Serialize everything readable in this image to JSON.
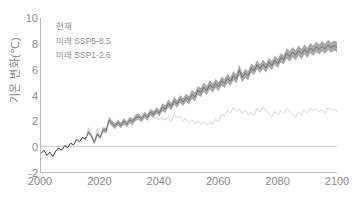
{
  "chart_data": {
    "type": "line",
    "title": "",
    "xlabel": "",
    "ylabel": "기온 변화(℃)",
    "xlim": [
      2000,
      2100
    ],
    "ylim": [
      -2,
      10
    ],
    "grid": false,
    "zero_line": true,
    "legend_position": "top-left",
    "xticks": [
      "2000",
      "2020",
      "2040",
      "2060",
      "2080",
      "2100"
    ],
    "xtick_values": [
      2000,
      2020,
      2040,
      2060,
      2080,
      2100
    ],
    "yticks": [
      "-2",
      "0",
      "2",
      "4",
      "6",
      "8",
      "10"
    ],
    "ytick_values": [
      -2,
      0,
      2,
      4,
      6,
      8,
      10
    ],
    "legend": [
      "현재",
      "미래 SSP5-8.5",
      "미래 SSP1-2.6"
    ],
    "colors": {
      "historical": "#3a3a3a",
      "ssp585_line": "#6e6e6e",
      "ssp585_band": "#9a9a9a",
      "ssp126_line": "#c9c9c9",
      "axis": "#b9b9b9",
      "text": "#8a8a8a"
    },
    "series": [
      {
        "name": "현재",
        "label": "현재",
        "color": "#3a3a3a",
        "x": [
          2000,
          2001,
          2002,
          2003,
          2004,
          2005,
          2006,
          2007,
          2008,
          2009,
          2010,
          2011,
          2012,
          2013,
          2014,
          2015
        ],
        "values": [
          -0.55,
          -0.3,
          -0.7,
          -0.45,
          -0.8,
          -0.35,
          -0.15,
          -0.3,
          0.05,
          -0.1,
          0.25,
          0.1,
          0.55,
          0.35,
          0.7,
          0.55
        ]
      },
      {
        "name": "미래 SSP5-8.5",
        "label": "미래 SSP5-8.5",
        "color": "#6e6e6e",
        "band_color": "#9a9a9a",
        "x": [
          2015,
          2016,
          2017,
          2018,
          2019,
          2020,
          2021,
          2022,
          2023,
          2024,
          2025,
          2026,
          2027,
          2028,
          2029,
          2030,
          2031,
          2032,
          2033,
          2034,
          2035,
          2036,
          2037,
          2038,
          2039,
          2040,
          2041,
          2042,
          2043,
          2044,
          2045,
          2046,
          2047,
          2048,
          2049,
          2050,
          2051,
          2052,
          2053,
          2054,
          2055,
          2056,
          2057,
          2058,
          2059,
          2060,
          2061,
          2062,
          2063,
          2064,
          2065,
          2066,
          2067,
          2068,
          2069,
          2070,
          2071,
          2072,
          2073,
          2074,
          2075,
          2076,
          2077,
          2078,
          2079,
          2080,
          2081,
          2082,
          2083,
          2084,
          2085,
          2086,
          2087,
          2088,
          2089,
          2090,
          2091,
          2092,
          2093,
          2094,
          2095,
          2096,
          2097,
          2098,
          2099,
          2100
        ],
        "values": [
          0.55,
          1.1,
          0.85,
          0.3,
          0.95,
          0.7,
          1.3,
          1.2,
          2.05,
          1.75,
          1.55,
          1.85,
          1.6,
          1.95,
          1.7,
          2.05,
          1.9,
          2.25,
          2.3,
          2.1,
          2.45,
          2.25,
          2.65,
          2.5,
          2.8,
          2.6,
          3.05,
          2.9,
          3.35,
          3.1,
          3.55,
          3.3,
          3.7,
          3.45,
          3.8,
          3.6,
          4.05,
          3.85,
          4.35,
          4.2,
          4.6,
          4.35,
          4.8,
          4.55,
          4.9,
          4.65,
          5.1,
          4.9,
          5.3,
          5.05,
          5.5,
          5.25,
          5.95,
          5.35,
          5.7,
          5.5,
          6.1,
          5.9,
          6.35,
          6.05,
          6.4,
          6.1,
          6.55,
          6.3,
          6.7,
          6.45,
          6.9,
          6.75,
          7.25,
          7.0,
          7.35,
          7.1,
          7.45,
          7.2,
          7.55,
          7.3,
          7.65,
          7.45,
          7.75,
          7.55,
          7.8,
          7.6,
          7.9,
          7.7,
          7.85,
          7.75
        ],
        "band_lower": [
          0.45,
          0.95,
          0.7,
          0.15,
          0.8,
          0.55,
          1.1,
          1.0,
          1.8,
          1.55,
          1.35,
          1.6,
          1.4,
          1.7,
          1.5,
          1.8,
          1.65,
          2.0,
          2.05,
          1.85,
          2.2,
          2.0,
          2.4,
          2.25,
          2.55,
          2.35,
          2.75,
          2.6,
          3.05,
          2.8,
          3.25,
          3.0,
          3.4,
          3.15,
          3.5,
          3.3,
          3.7,
          3.5,
          4.0,
          3.85,
          4.25,
          4.0,
          4.45,
          4.2,
          4.55,
          4.3,
          4.75,
          4.55,
          4.95,
          4.7,
          5.15,
          4.9,
          5.55,
          5.0,
          5.35,
          5.15,
          5.75,
          5.55,
          6.0,
          5.7,
          6.05,
          5.75,
          6.2,
          5.95,
          6.35,
          6.1,
          6.55,
          6.4,
          6.85,
          6.6,
          6.95,
          6.7,
          7.05,
          6.8,
          7.15,
          6.9,
          7.25,
          7.05,
          7.35,
          7.15,
          7.4,
          7.2,
          7.5,
          7.3,
          7.45,
          7.35
        ],
        "band_upper": [
          0.65,
          1.25,
          1.0,
          0.45,
          1.1,
          0.85,
          1.5,
          1.4,
          2.3,
          2.0,
          1.8,
          2.1,
          1.85,
          2.2,
          1.95,
          2.3,
          2.15,
          2.5,
          2.55,
          2.35,
          2.7,
          2.5,
          2.9,
          2.75,
          3.05,
          2.85,
          3.35,
          3.2,
          3.65,
          3.4,
          3.85,
          3.6,
          4.0,
          3.75,
          4.1,
          3.9,
          4.4,
          4.2,
          4.7,
          4.55,
          4.95,
          4.7,
          5.15,
          4.9,
          5.25,
          5.0,
          5.45,
          5.25,
          5.65,
          5.4,
          5.85,
          5.6,
          6.35,
          5.7,
          6.05,
          5.85,
          6.45,
          6.25,
          6.7,
          6.4,
          6.75,
          6.45,
          6.9,
          6.65,
          7.05,
          6.8,
          7.25,
          7.1,
          7.65,
          7.4,
          7.75,
          7.5,
          7.85,
          7.6,
          7.95,
          7.7,
          8.05,
          7.85,
          8.15,
          7.95,
          8.2,
          8.0,
          8.3,
          8.1,
          8.25,
          8.15
        ]
      },
      {
        "name": "미래 SSP1-2.6",
        "label": "미래 SSP1-2.6",
        "color": "#c9c9c9",
        "x": [
          2015,
          2016,
          2017,
          2018,
          2019,
          2020,
          2021,
          2022,
          2023,
          2024,
          2025,
          2026,
          2027,
          2028,
          2029,
          2030,
          2031,
          2032,
          2033,
          2034,
          2035,
          2036,
          2037,
          2038,
          2039,
          2040,
          2041,
          2042,
          2043,
          2044,
          2045,
          2046,
          2047,
          2048,
          2049,
          2050,
          2051,
          2052,
          2053,
          2054,
          2055,
          2056,
          2057,
          2058,
          2059,
          2060,
          2061,
          2062,
          2063,
          2064,
          2065,
          2066,
          2067,
          2068,
          2069,
          2070,
          2071,
          2072,
          2073,
          2074,
          2075,
          2076,
          2077,
          2078,
          2079,
          2080,
          2081,
          2082,
          2083,
          2084,
          2085,
          2086,
          2087,
          2088,
          2089,
          2090,
          2091,
          2092,
          2093,
          2094,
          2095,
          2096,
          2097,
          2098,
          2099,
          2100
        ],
        "values": [
          0.55,
          1.45,
          0.8,
          0.25,
          1.4,
          0.6,
          1.25,
          1.15,
          1.95,
          1.7,
          1.5,
          1.8,
          1.55,
          1.9,
          1.65,
          1.95,
          1.8,
          2.1,
          2.2,
          2.0,
          2.3,
          2.15,
          2.35,
          2.2,
          2.25,
          2.1,
          2.2,
          2.05,
          2.3,
          1.95,
          2.55,
          2.2,
          2.35,
          2.0,
          2.15,
          1.85,
          2.05,
          1.75,
          1.95,
          1.7,
          1.9,
          1.65,
          1.85,
          1.75,
          2.1,
          1.9,
          2.5,
          2.35,
          2.85,
          2.6,
          3.0,
          2.7,
          2.9,
          2.55,
          2.8,
          2.45,
          2.65,
          2.4,
          2.95,
          2.7,
          3.05,
          2.75,
          2.55,
          2.3,
          2.7,
          2.45,
          2.8,
          2.6,
          2.95,
          2.7,
          2.5,
          2.3,
          2.65,
          2.45,
          2.85,
          2.6,
          3.0,
          2.75,
          2.95,
          2.7,
          2.85,
          2.6,
          3.0,
          2.8,
          2.9,
          2.7
        ]
      }
    ]
  }
}
